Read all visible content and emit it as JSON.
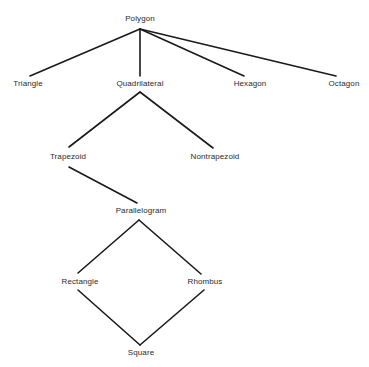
{
  "diagram": {
    "type": "hierarchy",
    "line_color": "#1a1a1a",
    "text_color": "#2a2a2a",
    "nodes": [
      {
        "id": "polygon",
        "label": "Polygon",
        "x": 140,
        "y": 19
      },
      {
        "id": "triangle",
        "label": "Triangle",
        "x": 28,
        "y": 84
      },
      {
        "id": "quadrilateral",
        "label": "Quadrilateral",
        "x": 140,
        "y": 84
      },
      {
        "id": "hexagon",
        "label": "Hexagon",
        "x": 250,
        "y": 84
      },
      {
        "id": "octagon",
        "label": "Octagon",
        "x": 344,
        "y": 84
      },
      {
        "id": "trapezoid",
        "label": "Trapezoid",
        "x": 68,
        "y": 157
      },
      {
        "id": "nontrapezoid",
        "label": "Nontrapezoid",
        "x": 215,
        "y": 157
      },
      {
        "id": "parallelogram",
        "label": "Parallelogram",
        "x": 141,
        "y": 211
      },
      {
        "id": "rectangle",
        "label": "Rectangle",
        "x": 80,
        "y": 282
      },
      {
        "id": "rhombus",
        "label": "Rhombus",
        "x": 205,
        "y": 282
      },
      {
        "id": "square",
        "label": "Square",
        "x": 141,
        "y": 353
      }
    ],
    "edges": [
      {
        "from": "polygon",
        "to": "triangle",
        "x1": 140,
        "y1": 29,
        "x2": 30,
        "y2": 76
      },
      {
        "from": "polygon",
        "to": "quadrilateral",
        "x1": 140,
        "y1": 29,
        "x2": 140,
        "y2": 76
      },
      {
        "from": "polygon",
        "to": "hexagon",
        "x1": 140,
        "y1": 29,
        "x2": 244,
        "y2": 76
      },
      {
        "from": "polygon",
        "to": "octagon",
        "x1": 140,
        "y1": 29,
        "x2": 336,
        "y2": 76
      },
      {
        "from": "quadrilateral",
        "to": "trapezoid",
        "x1": 140,
        "y1": 92,
        "x2": 69,
        "y2": 147
      },
      {
        "from": "quadrilateral",
        "to": "nontrapezoid",
        "x1": 140,
        "y1": 92,
        "x2": 213,
        "y2": 148
      },
      {
        "from": "trapezoid",
        "to": "parallelogram",
        "x1": 69,
        "y1": 167,
        "x2": 137,
        "y2": 203
      },
      {
        "from": "parallelogram",
        "to": "rectangle",
        "x1": 139,
        "y1": 220,
        "x2": 78,
        "y2": 273
      },
      {
        "from": "parallelogram",
        "to": "rhombus",
        "x1": 139,
        "y1": 220,
        "x2": 201,
        "y2": 274
      },
      {
        "from": "rectangle",
        "to": "square",
        "x1": 78,
        "y1": 290,
        "x2": 140,
        "y2": 345
      },
      {
        "from": "rhombus",
        "to": "square",
        "x1": 204,
        "y1": 290,
        "x2": 140,
        "y2": 345
      }
    ]
  }
}
